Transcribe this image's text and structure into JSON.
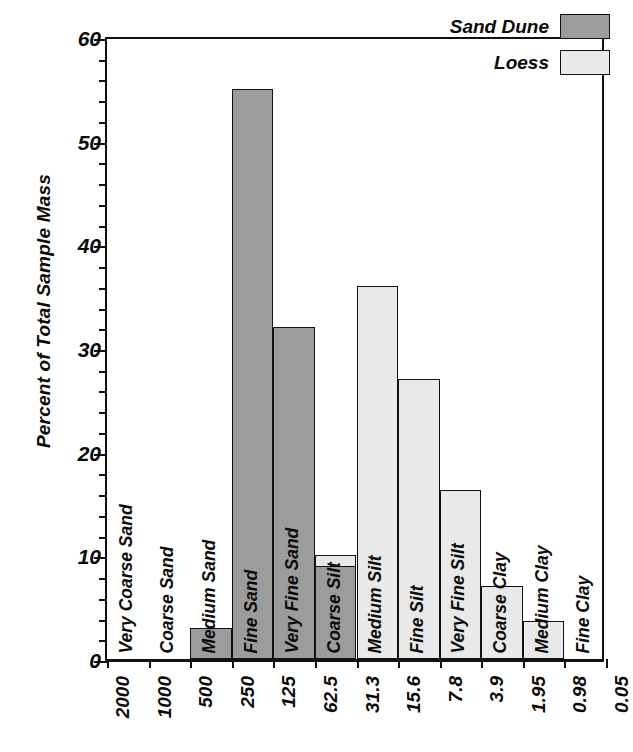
{
  "chart_data": {
    "type": "bar",
    "title": "",
    "subtitle": "",
    "xlabel": "",
    "ylabel": "Percent of Total Sample Mass",
    "ylim": [
      0,
      60
    ],
    "ytick_labels": [
      "0",
      "10",
      "20",
      "30",
      "40",
      "50",
      "60"
    ],
    "ytick_values": [
      0,
      10,
      20,
      30,
      40,
      50,
      60
    ],
    "ytick_minor_step": 2,
    "grid": false,
    "legend_position": "top-right",
    "x_axis_note": "particle size boundaries in micrometres, log scale, decreasing left to right",
    "xtick_labels": [
      "2000",
      "1000",
      "500",
      "250",
      "125",
      "62.5",
      "31.3",
      "15.6",
      "7.8",
      "3.9",
      "1.95",
      "0.98",
      "0.05"
    ],
    "categories": [
      "Very Coarse Sand",
      "Coarse Sand",
      "Medium Sand",
      "Fine Sand",
      "Very Fine Sand",
      "Coarse Silt",
      "Medium Silt",
      "Fine Silt",
      "Very Fine Silt",
      "Coarse Clay",
      "Medium Clay",
      "Fine Clay"
    ],
    "series": [
      {
        "name": "Sand Dune",
        "color": "#9c9c9c",
        "values": [
          0,
          0,
          3,
          55,
          32,
          9,
          0,
          0,
          0,
          0,
          0,
          0
        ]
      },
      {
        "name": "Loess",
        "color": "#e9e9e9",
        "values": [
          0,
          0,
          0,
          0,
          2,
          10,
          36,
          27,
          16.3,
          7,
          3.7,
          0
        ]
      }
    ]
  },
  "legend": {
    "entries": [
      {
        "label": "Sand Dune",
        "swatch": "dune"
      },
      {
        "label": "Loess",
        "swatch": "loess"
      }
    ]
  }
}
